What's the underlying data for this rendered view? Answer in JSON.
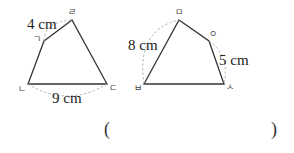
{
  "figures": [
    {
      "name": "quadrilateral-left",
      "vertices": [
        {
          "label": "ㄱ",
          "x": 44,
          "y": 41
        },
        {
          "label": "ㄹ",
          "x": 72,
          "y": 20
        },
        {
          "label": "ㄷ",
          "x": 107,
          "y": 84
        },
        {
          "label": "ㄴ",
          "x": 28,
          "y": 84
        }
      ],
      "measurements": [
        {
          "side": "ㄱㄹ",
          "text": "4 cm"
        },
        {
          "side": "ㄴㄷ",
          "text": "9 cm"
        }
      ]
    },
    {
      "name": "quadrilateral-right",
      "vertices": [
        {
          "label": "ㅁ",
          "x": 179,
          "y": 20
        },
        {
          "label": "ㅇ",
          "x": 209,
          "y": 41
        },
        {
          "label": "ㅅ",
          "x": 224,
          "y": 84
        },
        {
          "label": "ㅂ",
          "x": 144,
          "y": 84
        }
      ],
      "measurements": [
        {
          "side": "ㅂㅁ",
          "text": "8 cm"
        },
        {
          "side": "ㅇㅅ",
          "text": "5 cm"
        }
      ]
    }
  ],
  "answer": {
    "open_paren": "(",
    "close_paren": ")",
    "value": ""
  },
  "colors": {
    "line": "#333333",
    "dashed": "#aaaaaa"
  }
}
